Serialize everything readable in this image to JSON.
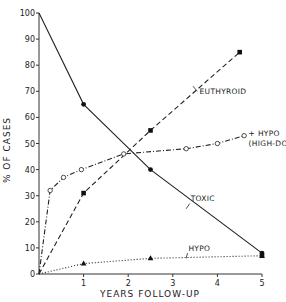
{
  "chart_data": {
    "type": "line",
    "title": "",
    "xlabel": "YEARS FOLLOW-UP",
    "ylabel": "% OF CASES",
    "xlim": [
      0,
      5
    ],
    "ylim": [
      0,
      100
    ],
    "x_ticks": [
      1,
      2,
      3,
      4,
      5
    ],
    "y_ticks": [
      0,
      10,
      20,
      30,
      40,
      50,
      60,
      70,
      80,
      90,
      100
    ],
    "grid": false,
    "legend_position": "inline labels",
    "series": [
      {
        "name": "TOXIC",
        "style": "solid",
        "marker": "filled-circle",
        "x": [
          0,
          1,
          2.5,
          5
        ],
        "y": [
          100,
          65,
          40,
          8
        ]
      },
      {
        "name": "EUTHYROID",
        "style": "dashed",
        "marker": "filled-square",
        "x": [
          0,
          1,
          2.5,
          4.5
        ],
        "y": [
          0,
          31,
          55,
          85
        ]
      },
      {
        "name": "HYPO (HIGH-DOSE)",
        "style": "dash-dot",
        "marker": "open-circle",
        "x": [
          0,
          0.25,
          0.55,
          0.95,
          1.9,
          3.3,
          4.0,
          4.6
        ],
        "y": [
          0,
          32,
          37,
          40,
          46,
          48,
          50,
          53
        ]
      },
      {
        "name": "HYPO",
        "style": "dotted",
        "marker": "filled-triangle",
        "x": [
          0,
          1,
          2.5,
          5
        ],
        "y": [
          0,
          4,
          6,
          7
        ]
      }
    ],
    "annotations": [
      {
        "text": "EUTHYROID",
        "x": 3.6,
        "y": 69
      },
      {
        "text": "+ HYPO",
        "x": 4.7,
        "y": 53
      },
      {
        "text": "(HIGH-DOSE)",
        "x": 4.7,
        "y": 49
      },
      {
        "text": "TOXIC",
        "x": 3.4,
        "y": 28
      },
      {
        "text": "HYPO",
        "x": 3.35,
        "y": 9
      }
    ]
  }
}
